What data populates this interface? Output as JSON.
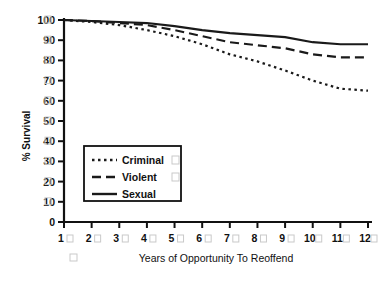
{
  "chart_data": {
    "type": "line",
    "title": "",
    "xlabel": "Years of Opportunity To Reoffend",
    "ylabel": "% Survival",
    "x": [
      1,
      2,
      3,
      4,
      5,
      6,
      7,
      8,
      9,
      10,
      11,
      12
    ],
    "xlim": [
      1,
      12
    ],
    "ylim": [
      0,
      100
    ],
    "grid": false,
    "legend_position": "center-left",
    "yticks": [
      0,
      10,
      20,
      30,
      40,
      50,
      60,
      70,
      80,
      90,
      100
    ],
    "ytick_labels": [
      "0",
      "10",
      "20",
      "30",
      "40",
      "50",
      "60",
      "70",
      "80",
      "90",
      "100"
    ],
    "xtick_labels": [
      "1",
      "2",
      "3",
      "4",
      "5",
      "6",
      "7",
      "8",
      "9",
      "10",
      "11",
      "12"
    ],
    "series": [
      {
        "name": "Criminal",
        "style": "dotted",
        "values": [
          100,
          99,
          97.5,
          95,
          92,
          88,
          83,
          79.5,
          75,
          70,
          66,
          65
        ]
      },
      {
        "name": "Violent",
        "style": "dashed",
        "values": [
          100,
          99.5,
          98.5,
          97.5,
          95,
          92,
          89,
          87.5,
          86,
          83,
          81.5,
          81.5
        ]
      },
      {
        "name": "Sexual",
        "style": "solid",
        "values": [
          100,
          99.5,
          99,
          98.5,
          97,
          95,
          93.5,
          92.5,
          91.5,
          89,
          88,
          88
        ]
      }
    ]
  },
  "legend": {
    "items": [
      {
        "label": "Criminal",
        "style": "dotted"
      },
      {
        "label": "Violent",
        "style": "dashed"
      },
      {
        "label": "Sexual",
        "style": "solid"
      }
    ]
  }
}
